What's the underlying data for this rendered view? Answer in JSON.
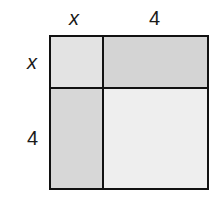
{
  "diagram": {
    "type": "area-model",
    "top_labels": [
      "x",
      "4"
    ],
    "side_labels": [
      "x",
      "4"
    ],
    "regions": [
      {
        "name": "x-by-x",
        "fill": "#e3e3e3"
      },
      {
        "name": "4-by-x-top",
        "fill": "#d4d4d4"
      },
      {
        "name": "x-by-4-left",
        "fill": "#d7d7d7"
      },
      {
        "name": "4-by-4",
        "fill": "#eeeeee"
      }
    ],
    "stroke": "#111111"
  }
}
